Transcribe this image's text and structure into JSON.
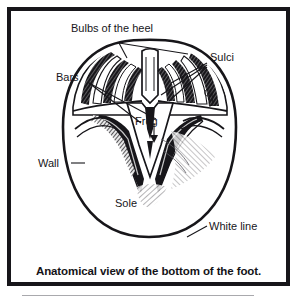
{
  "figure": {
    "caption": "Anatomical view of the bottom of the foot.",
    "frame_color": "#17161a",
    "background_color": "#ffffff",
    "ink_color": "#17161a",
    "rule_color": "#a9a9ad"
  },
  "labels": {
    "bulbs_of_the_heel": "Bulbs of the heel",
    "sulci": "Sulci",
    "bars": "Bars",
    "frog": "Frog",
    "wall": "Wall",
    "sole": "Sole",
    "white_line": "White line"
  }
}
